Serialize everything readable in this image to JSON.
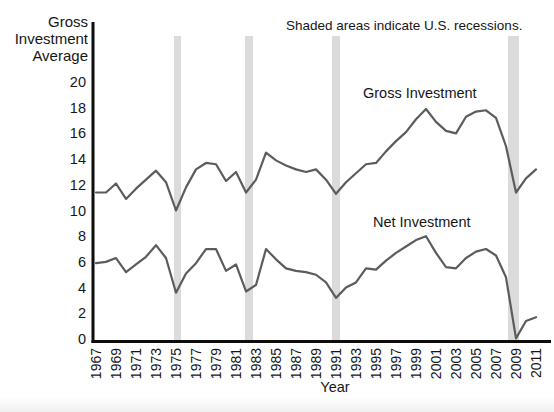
{
  "ylabel_lines": [
    "Gross",
    "Investment",
    "Average"
  ],
  "colors": {
    "line": "#5c5c5c",
    "recession_band": "#dbdbdb",
    "axis": "#0d0d0d",
    "text": "#161616"
  },
  "chart_data": {
    "type": "line",
    "title": "",
    "note": "Shaded areas indicate U.S. recessions.",
    "ylabel": "Gross Investment Average",
    "xlabel": "Year",
    "xlim": [
      1967,
      2011
    ],
    "ylim": [
      0,
      20
    ],
    "grid": false,
    "legend_position": "inline-labels",
    "x": [
      1967,
      1968,
      1969,
      1970,
      1971,
      1972,
      1973,
      1974,
      1975,
      1976,
      1977,
      1978,
      1979,
      1980,
      1981,
      1982,
      1983,
      1984,
      1985,
      1986,
      1987,
      1988,
      1989,
      1990,
      1991,
      1992,
      1993,
      1994,
      1995,
      1996,
      1997,
      1998,
      1999,
      2000,
      2001,
      2002,
      2003,
      2004,
      2005,
      2006,
      2007,
      2008,
      2009,
      2010,
      2011
    ],
    "x_tick_labels": [
      1967,
      1969,
      1971,
      1973,
      1975,
      1977,
      1979,
      1981,
      1983,
      1985,
      1987,
      1989,
      1991,
      1993,
      1995,
      1997,
      1999,
      2001,
      2003,
      2005,
      2007,
      2009,
      2011
    ],
    "y_ticks": [
      0,
      2,
      4,
      6,
      8,
      10,
      12,
      14,
      16,
      18,
      20
    ],
    "series": [
      {
        "name": "Gross Investment",
        "values": [
          11.4,
          11.4,
          12.1,
          10.9,
          11.7,
          12.4,
          13.1,
          12.2,
          10.0,
          11.8,
          13.2,
          13.7,
          13.6,
          12.3,
          13.0,
          11.4,
          12.4,
          14.5,
          13.9,
          13.5,
          13.2,
          13.0,
          13.2,
          12.4,
          11.3,
          12.2,
          12.9,
          13.6,
          13.7,
          14.6,
          15.4,
          16.1,
          17.1,
          17.9,
          16.9,
          16.2,
          16.0,
          17.3,
          17.7,
          17.8,
          17.2,
          15.0,
          11.4,
          12.5,
          13.2
        ]
      },
      {
        "name": "Net Investment",
        "values": [
          5.9,
          6.0,
          6.3,
          5.2,
          5.8,
          6.4,
          7.3,
          6.3,
          3.6,
          5.1,
          5.9,
          7.0,
          7.0,
          5.3,
          5.8,
          3.7,
          4.2,
          7.0,
          6.2,
          5.5,
          5.3,
          5.2,
          5.0,
          4.4,
          3.2,
          4.0,
          4.4,
          5.5,
          5.4,
          6.1,
          6.7,
          7.2,
          7.7,
          8.0,
          6.7,
          5.6,
          5.5,
          6.3,
          6.8,
          7.0,
          6.5,
          4.8,
          0.05,
          1.4,
          1.7
        ]
      }
    ],
    "recessions": [
      [
        1974.8,
        1975.5
      ],
      [
        1981.9,
        1982.7
      ],
      [
        1990.6,
        1991.4
      ],
      [
        2008.2,
        2009.3
      ]
    ]
  }
}
